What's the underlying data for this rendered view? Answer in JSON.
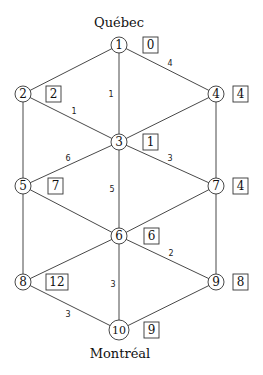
{
  "diagram": {
    "type": "weighted-graph",
    "labels": {
      "top_city": "Québec",
      "bottom_city": "Montréal"
    },
    "nodes": [
      {
        "id": "1",
        "x": 119,
        "y": 45,
        "value": "0"
      },
      {
        "id": "2",
        "x": 23,
        "y": 94,
        "value": "2"
      },
      {
        "id": "3",
        "x": 119,
        "y": 142,
        "value": "1"
      },
      {
        "id": "4",
        "x": 216,
        "y": 94,
        "value": "4"
      },
      {
        "id": "5",
        "x": 23,
        "y": 186,
        "value": "7"
      },
      {
        "id": "6",
        "x": 119,
        "y": 236,
        "value": "6"
      },
      {
        "id": "7",
        "x": 216,
        "y": 186,
        "value": "4"
      },
      {
        "id": "8",
        "x": 23,
        "y": 282,
        "value": "12"
      },
      {
        "id": "9",
        "x": 216,
        "y": 282,
        "value": "8"
      },
      {
        "id": "10",
        "x": 119,
        "y": 330,
        "value": "9"
      }
    ],
    "edges": [
      {
        "from": "1",
        "to": "2",
        "weight": ""
      },
      {
        "from": "1",
        "to": "4",
        "weight": "4"
      },
      {
        "from": "1",
        "to": "3",
        "weight": "1"
      },
      {
        "from": "2",
        "to": "3",
        "weight": "1"
      },
      {
        "from": "4",
        "to": "3",
        "weight": ""
      },
      {
        "from": "2",
        "to": "5",
        "weight": ""
      },
      {
        "from": "4",
        "to": "7",
        "weight": ""
      },
      {
        "from": "3",
        "to": "5",
        "weight": "6"
      },
      {
        "from": "3",
        "to": "7",
        "weight": "3"
      },
      {
        "from": "3",
        "to": "6",
        "weight": "5"
      },
      {
        "from": "5",
        "to": "6",
        "weight": ""
      },
      {
        "from": "7",
        "to": "6",
        "weight": ""
      },
      {
        "from": "5",
        "to": "8",
        "weight": ""
      },
      {
        "from": "7",
        "to": "9",
        "weight": ""
      },
      {
        "from": "6",
        "to": "8",
        "weight": ""
      },
      {
        "from": "6",
        "to": "9",
        "weight": "2"
      },
      {
        "from": "6",
        "to": "10",
        "weight": "3"
      },
      {
        "from": "8",
        "to": "10",
        "weight": "3"
      },
      {
        "from": "9",
        "to": "10",
        "weight": ""
      }
    ]
  }
}
